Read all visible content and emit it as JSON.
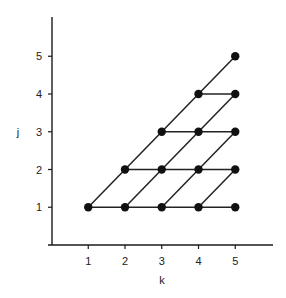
{
  "figure": {
    "x_axis": {
      "title": "k",
      "ticks": [
        "1",
        "2",
        "3",
        "4",
        "5"
      ],
      "range": [
        0,
        6
      ]
    },
    "y_axis": {
      "title": "j",
      "ticks": [
        "1",
        "2",
        "3",
        "4",
        "5"
      ],
      "range": [
        0,
        6
      ]
    },
    "nodes": [
      {
        "k": 1,
        "j": 1
      },
      {
        "k": 2,
        "j": 1
      },
      {
        "k": 3,
        "j": 1
      },
      {
        "k": 4,
        "j": 1
      },
      {
        "k": 5,
        "j": 1
      },
      {
        "k": 2,
        "j": 2
      },
      {
        "k": 3,
        "j": 2
      },
      {
        "k": 4,
        "j": 2
      },
      {
        "k": 5,
        "j": 2
      },
      {
        "k": 3,
        "j": 3
      },
      {
        "k": 4,
        "j": 3
      },
      {
        "k": 5,
        "j": 3
      },
      {
        "k": 4,
        "j": 4
      },
      {
        "k": 5,
        "j": 4
      },
      {
        "k": 5,
        "j": 5
      }
    ],
    "horizontal_edges": [
      {
        "j": 1,
        "k_from": 1,
        "k_to": 5
      },
      {
        "j": 2,
        "k_from": 2,
        "k_to": 5
      },
      {
        "j": 3,
        "k_from": 3,
        "k_to": 5
      },
      {
        "j": 4,
        "k_from": 4,
        "k_to": 5
      }
    ],
    "diagonal_edges": [
      {
        "from": {
          "k": 1,
          "j": 1
        },
        "to": {
          "k": 5,
          "j": 5
        }
      },
      {
        "from": {
          "k": 2,
          "j": 1
        },
        "to": {
          "k": 5,
          "j": 4
        }
      },
      {
        "from": {
          "k": 3,
          "j": 1
        },
        "to": {
          "k": 5,
          "j": 3
        }
      },
      {
        "from": {
          "k": 4,
          "j": 1
        },
        "to": {
          "k": 5,
          "j": 2
        }
      }
    ],
    "colors": {
      "line": "#222222",
      "node": "#111111",
      "background": "#ffffff"
    }
  }
}
